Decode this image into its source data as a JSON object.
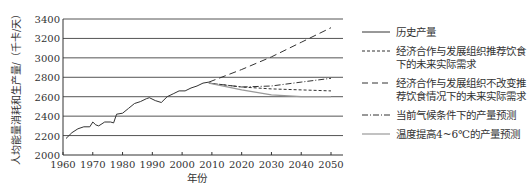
{
  "chart_data": {
    "type": "line",
    "title": "",
    "xlabel": "年份",
    "ylabel": "人均能量消耗和生产量/（千卡/天）",
    "xlim": [
      1960,
      2050
    ],
    "ylim": [
      2000,
      3400
    ],
    "x_ticks": [
      1960,
      1970,
      1980,
      1990,
      2000,
      2010,
      2020,
      2030,
      2040,
      2050
    ],
    "y_ticks": [
      2000,
      2200,
      2400,
      2600,
      2800,
      3000,
      3200,
      3400
    ],
    "grid": "horizontal",
    "legend_position": "right",
    "series": [
      {
        "name": "历史产量",
        "style": "solid",
        "color": "#333333",
        "x": [
          1961,
          1963,
          1965,
          1967,
          1969,
          1970,
          1971,
          1972,
          1974,
          1976,
          1977,
          1978,
          1980,
          1982,
          1984,
          1986,
          1988,
          1989,
          1991,
          1993,
          1995,
          1997,
          1999,
          2001,
          2003,
          2005,
          2007,
          2009
        ],
        "y": [
          2170,
          2230,
          2270,
          2290,
          2290,
          2340,
          2310,
          2300,
          2340,
          2340,
          2330,
          2420,
          2430,
          2480,
          2530,
          2550,
          2580,
          2590,
          2560,
          2540,
          2600,
          2630,
          2660,
          2660,
          2690,
          2710,
          2740,
          2750
        ]
      },
      {
        "name": "经济合作与发展组织推荐饮食下的未来实际需求",
        "style": "short-dash",
        "color": "#333333",
        "x": [
          2009,
          2020,
          2030,
          2040,
          2050
        ],
        "y": [
          2740,
          2700,
          2680,
          2670,
          2660
        ]
      },
      {
        "name": "经济合作与发展组织不改变推荐饮食情况下的未来实际需求",
        "style": "long-dash",
        "color": "#333333",
        "x": [
          2009,
          2020,
          2030,
          2040,
          2050
        ],
        "y": [
          2750,
          2880,
          3010,
          3160,
          3310
        ]
      },
      {
        "name": "当前气候条件下的产量预测",
        "style": "dash-dot",
        "color": "#333333",
        "x": [
          2009,
          2020,
          2030,
          2040,
          2050
        ],
        "y": [
          2740,
          2700,
          2710,
          2750,
          2790
        ]
      },
      {
        "name": "温度提高4~6℃的产量预测",
        "style": "solid",
        "color": "#999999",
        "x": [
          2009,
          2020,
          2030,
          2040,
          2050
        ],
        "y": [
          2740,
          2670,
          2620,
          2600,
          2600
        ]
      }
    ]
  },
  "legend": {
    "items": [
      {
        "label": "历史产量",
        "style": "solid",
        "color": "#333333"
      },
      {
        "label": "经济合作与发展组织推荐饮食下的未来实际需求",
        "style": "short-dash",
        "color": "#333333"
      },
      {
        "label": "经济合作与发展组织不改变推荐饮食情况下的未来实际需求",
        "style": "long-dash",
        "color": "#333333"
      },
      {
        "label": "当前气候条件下的产量预测",
        "style": "dash-dot",
        "color": "#333333"
      },
      {
        "label": "温度提高4~6℃的产量预测",
        "style": "solid",
        "color": "#999999"
      }
    ]
  }
}
